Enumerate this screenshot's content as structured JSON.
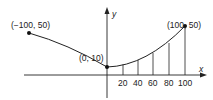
{
  "diagram": {
    "type": "parabola-cable",
    "axes": {
      "x_label": "x",
      "y_label": "y"
    },
    "points": [
      {
        "label": "(−100, 50)",
        "x": -100,
        "y": 50
      },
      {
        "label": "(0, 10)",
        "x": 0,
        "y": 10
      },
      {
        "label": "(100, 50)",
        "x": 100,
        "y": 50
      }
    ],
    "tick_labels": [
      "20",
      "40",
      "60",
      "80",
      "100"
    ],
    "vertical_lines_at_x": [
      20,
      40,
      60,
      80,
      100
    ]
  }
}
